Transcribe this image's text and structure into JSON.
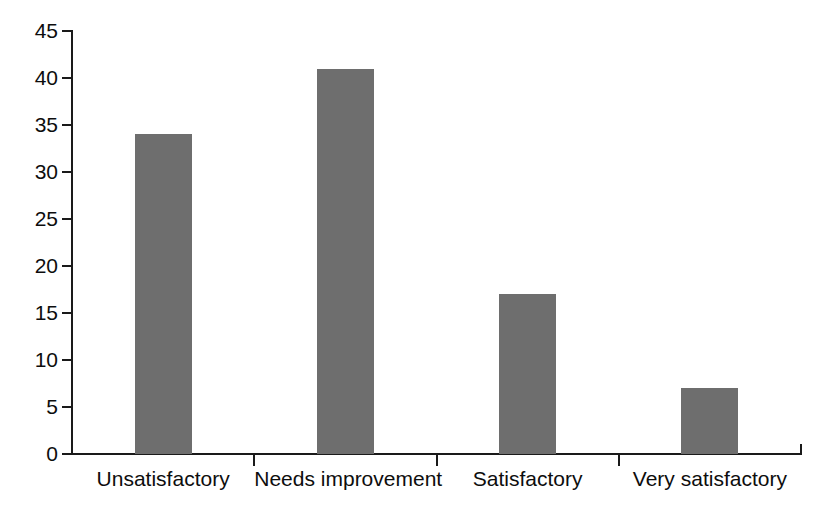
{
  "chart_data": {
    "type": "bar",
    "title": "",
    "subtitle": "",
    "xlabel": "",
    "ylabel": "",
    "categories": [
      "Unsatisfactory",
      "Needs improvement",
      "Satisfactory",
      "Very satisfactory"
    ],
    "values": [
      34,
      41,
      17,
      7
    ],
    "ylim": [
      0,
      45
    ],
    "ytick_labels": [
      "0",
      "5",
      "10",
      "15",
      "20",
      "25",
      "30",
      "35",
      "40",
      "45"
    ],
    "ytick_values": [
      0,
      5,
      10,
      15,
      20,
      25,
      30,
      35,
      40,
      45
    ],
    "ytick_step": 5,
    "grid": false,
    "legend": false,
    "legend_position": "none",
    "bar_color": "#6e6e6e",
    "axis_color": "#1a1a1a",
    "text_color": "#0d0d0d",
    "background_color": "#ffffff",
    "annotations": []
  }
}
